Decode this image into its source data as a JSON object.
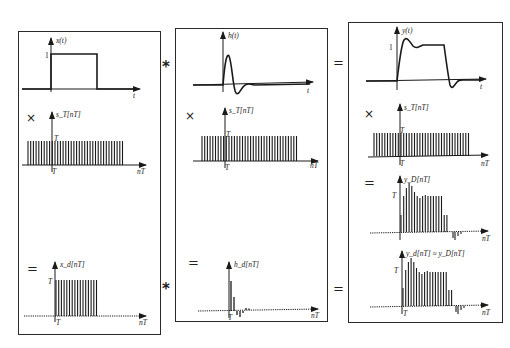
{
  "diagram": {
    "panels": [
      {
        "id": "input",
        "rows": [
          {
            "operator": "",
            "label": "x(t)",
            "level_tick": "1",
            "x_axis": "t",
            "type": "continuous-rect"
          },
          {
            "operator": "×",
            "label": "s_T[nT]",
            "level_tick": "T",
            "origin_tick": "T",
            "x_axis": "nT",
            "type": "impulse-train"
          },
          {
            "operator": "=",
            "label": "x_d[nT]",
            "level_tick": "T",
            "origin_tick": "T",
            "x_axis": "nT",
            "type": "sampled-rect"
          }
        ]
      },
      {
        "id": "system",
        "rows": [
          {
            "operator": "",
            "label": "h(t)",
            "x_axis": "t",
            "type": "continuous-impulse-response"
          },
          {
            "operator": "×",
            "label": "s_T[nT]",
            "level_tick": "T",
            "origin_tick": "T",
            "x_axis": "nT",
            "type": "impulse-train"
          },
          {
            "operator": "=",
            "label": "h_d[nT]",
            "origin_tick": "T",
            "x_axis": "nT",
            "type": "sampled-impulse-response"
          }
        ]
      },
      {
        "id": "output",
        "rows": [
          {
            "operator": "",
            "label": "y(t)",
            "level_tick": "1",
            "x_axis": "t",
            "type": "continuous-response"
          },
          {
            "operator": "×",
            "label": "s_T[nT]",
            "level_tick": "T",
            "origin_tick": "T",
            "x_axis": "nT",
            "type": "impulse-train"
          },
          {
            "operator": "=",
            "label": "y_D[nT]",
            "level_tick": "T",
            "x_axis": "nT",
            "type": "sampled-response"
          },
          {
            "operator": "",
            "label": "y_d[nT] ≈ y_D[nT]",
            "level_tick": "T",
            "origin_tick": "T",
            "x_axis": "nT",
            "type": "discrete-convolution-result"
          }
        ]
      }
    ],
    "between_panels": {
      "top_left_op": "*",
      "top_right_op": "=",
      "bottom_left_op": "*",
      "bottom_right_op": "="
    },
    "colors": {
      "ink": "#1a1a1a",
      "border": "#2a2a2a",
      "background": "#ffffff"
    }
  }
}
